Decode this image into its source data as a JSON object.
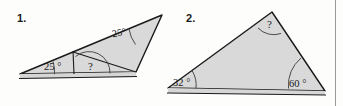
{
  "page": {
    "width": 343,
    "height": 106,
    "background_color": "#fdfdfc",
    "divider_color": "#9a9a9a"
  },
  "figures": [
    {
      "number_label": "1.",
      "shape": "triangle-with-interior-segment",
      "fill_color": "#d9d9d9",
      "stroke_color": "#1a1a1a",
      "vertices": {
        "left": [
          20,
          74
        ],
        "apex": [
          162,
          15
        ],
        "bottom_right": [
          136,
          72
        ]
      },
      "interior_point": [
        73,
        55
      ],
      "angles": [
        {
          "name": "bottom-left-angle",
          "value": "25",
          "unit": "°",
          "text": "25 °"
        },
        {
          "name": "apex-angle",
          "value": "25",
          "unit": "°",
          "text": "25°"
        },
        {
          "name": "unknown-angle",
          "value": "?",
          "unit": "",
          "text": "?"
        }
      ]
    },
    {
      "number_label": "2.",
      "shape": "triangle",
      "fill_color": "#d9d9d9",
      "stroke_color": "#1a1a1a",
      "vertices": {
        "left": [
          168,
          88
        ],
        "top": [
          272,
          12
        ],
        "bottom_right": [
          325,
          91
        ]
      },
      "angles": [
        {
          "name": "left-angle",
          "value": "32",
          "unit": "°",
          "text": "32 °"
        },
        {
          "name": "top-angle",
          "value": "?",
          "unit": "",
          "text": "?"
        },
        {
          "name": "bottom-right-angle",
          "value": "60",
          "unit": "°",
          "text": "60 °"
        }
      ]
    }
  ]
}
